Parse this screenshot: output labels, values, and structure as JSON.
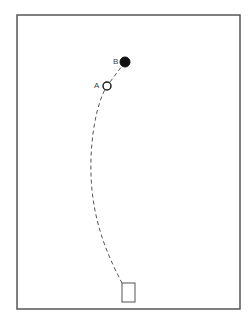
{
  "diagram": {
    "frame": {
      "x": 17,
      "y": 15,
      "width": 223,
      "height": 294,
      "stroke": "#555555"
    },
    "points": [
      {
        "id": "B",
        "label": "B",
        "cx": 125,
        "cy": 62,
        "r": 5,
        "filled": true,
        "label_x": 113,
        "label_y": 64
      },
      {
        "id": "A",
        "label": "A",
        "cx": 107,
        "cy": 86,
        "r": 4,
        "filled": false,
        "label_x": 94,
        "label_y": 88
      }
    ],
    "path": {
      "style": "dashed",
      "d": "M 125 62 L 107 86 C 95 105, 88 150, 92 190 C 96 230, 110 260, 122 283"
    },
    "target_box": {
      "x": 122,
      "y": 283,
      "width": 13,
      "height": 19
    }
  }
}
